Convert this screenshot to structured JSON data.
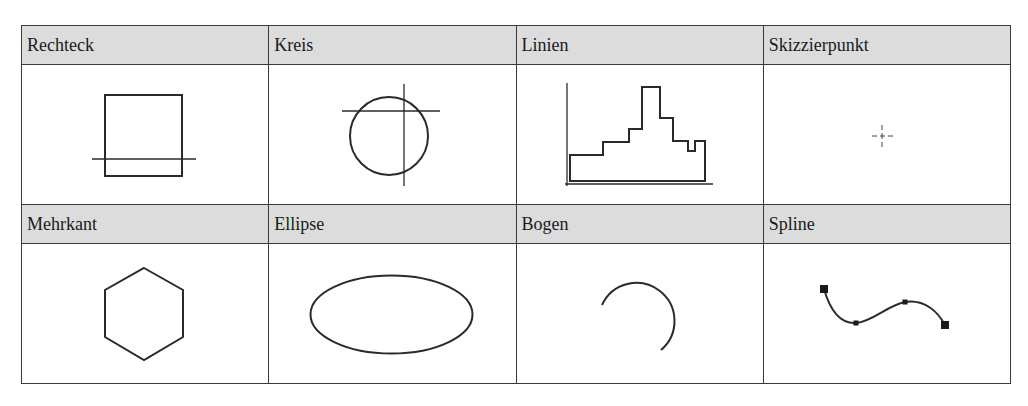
{
  "table": {
    "rows": [
      {
        "headers": [
          "Rechteck",
          "Kreis",
          "Linien",
          "Skizzierpunkt"
        ],
        "figures": [
          "rectangle-sketch",
          "circle-sketch",
          "polyline-sketch",
          "sketch-point"
        ]
      },
      {
        "headers": [
          "Mehrkant",
          "Ellipse",
          "Bogen",
          "Spline"
        ],
        "figures": [
          "polygon-sketch",
          "ellipse-sketch",
          "arc-sketch",
          "spline-sketch"
        ]
      }
    ],
    "colors": {
      "header_fill": "#dcdcdc",
      "border": "#3a3a3a",
      "stroke": "#2a2a2a"
    }
  }
}
